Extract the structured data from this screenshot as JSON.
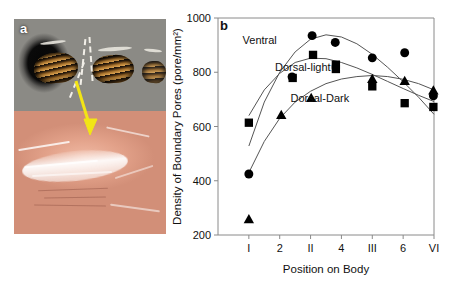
{
  "figure": {
    "panel_a": {
      "label": "a",
      "description": "photomicrograph composite: dark honeycomb mesh with golden banded interiors over pink tissue with white fibrous sheath",
      "arrow_color": "#f2e515",
      "dashed_marker_color": "#f2efe8"
    },
    "panel_b": {
      "label": "b"
    }
  },
  "chart_data": {
    "type": "scatter",
    "title": "",
    "xlabel": "Position on Body",
    "ylabel": "Density of Boundary Pores (pore/mm²)",
    "ylim": [
      200,
      1000
    ],
    "yticks": [
      200,
      400,
      600,
      800,
      1000
    ],
    "xlim": [
      0,
      7
    ],
    "xticks": [
      1,
      2,
      3,
      4,
      5,
      6,
      7
    ],
    "xticklabels": [
      "I",
      "2",
      "II",
      "4",
      "III",
      "6",
      "VI"
    ],
    "grid": false,
    "legend": "inline-annotations",
    "annotations": [
      {
        "text": "Ventral",
        "x": 1.35,
        "y": 905
      },
      {
        "text": "Dorsal-light",
        "x": 2.75,
        "y": 805
      },
      {
        "text": "Dorsal-Dark",
        "x": 3.3,
        "y": 690
      }
    ],
    "series": [
      {
        "name": "Ventral",
        "marker": "circle",
        "color": "#000000",
        "points": [
          {
            "x": 1.0,
            "y": 425
          },
          {
            "x": 2.4,
            "y": 783
          },
          {
            "x": 3.05,
            "y": 935
          },
          {
            "x": 3.8,
            "y": 910
          },
          {
            "x": 5.0,
            "y": 853
          },
          {
            "x": 6.05,
            "y": 872
          },
          {
            "x": 6.98,
            "y": 713
          }
        ],
        "fit": {
          "type": "quadratic",
          "y_at": [
            [
              1.0,
              528
            ],
            [
              1.5,
              690
            ],
            [
              2.0,
              800
            ],
            [
              2.5,
              875
            ],
            [
              3.0,
              922
            ],
            [
              3.5,
              938
            ],
            [
              4.0,
              930
            ],
            [
              4.5,
              905
            ],
            [
              5.0,
              866
            ],
            [
              5.5,
              818
            ],
            [
              6.0,
              765
            ],
            [
              6.5,
              708
            ],
            [
              7.0,
              645
            ]
          ]
        }
      },
      {
        "name": "Dorsal-light",
        "marker": "square",
        "color": "#000000",
        "points": [
          {
            "x": 1.0,
            "y": 614
          },
          {
            "x": 2.42,
            "y": 779
          },
          {
            "x": 3.08,
            "y": 864
          },
          {
            "x": 3.82,
            "y": 828
          },
          {
            "x": 3.82,
            "y": 812
          },
          {
            "x": 5.0,
            "y": 748
          },
          {
            "x": 6.05,
            "y": 686
          },
          {
            "x": 6.98,
            "y": 672
          }
        ],
        "fit": {
          "type": "quadratic",
          "y_at": [
            [
              1.0,
              640
            ],
            [
              1.5,
              735
            ],
            [
              2.0,
              796
            ],
            [
              2.5,
              836
            ],
            [
              3.0,
              852
            ],
            [
              3.5,
              850
            ],
            [
              4.0,
              836
            ],
            [
              4.5,
              816
            ],
            [
              5.0,
              792
            ],
            [
              5.5,
              766
            ],
            [
              6.0,
              740
            ],
            [
              6.5,
              715
            ],
            [
              7.0,
              692
            ]
          ]
        }
      },
      {
        "name": "Dorsal-Dark",
        "marker": "triangle",
        "color": "#000000",
        "points": [
          {
            "x": 1.0,
            "y": 258
          },
          {
            "x": 2.05,
            "y": 643
          },
          {
            "x": 3.02,
            "y": 705
          },
          {
            "x": 5.0,
            "y": 775
          },
          {
            "x": 6.05,
            "y": 768
          },
          {
            "x": 6.98,
            "y": 733
          }
        ],
        "fit": {
          "type": "quadratic",
          "y_at": [
            [
              1.0,
              430
            ],
            [
              1.5,
              545
            ],
            [
              2.0,
              630
            ],
            [
              2.5,
              690
            ],
            [
              3.0,
              730
            ],
            [
              3.5,
              758
            ],
            [
              4.0,
              775
            ],
            [
              4.5,
              784
            ],
            [
              5.0,
              788
            ],
            [
              5.5,
              784
            ],
            [
              6.0,
              774
            ],
            [
              6.5,
              758
            ],
            [
              7.0,
              735
            ]
          ]
        }
      }
    ]
  }
}
